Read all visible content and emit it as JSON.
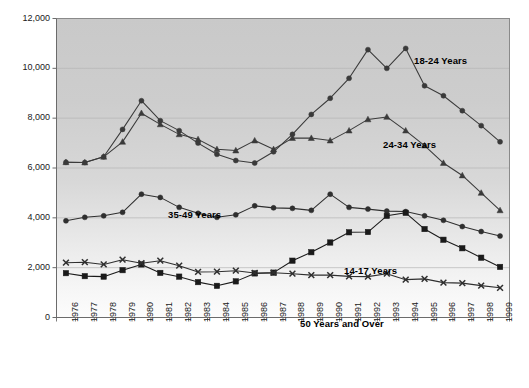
{
  "chart_data": {
    "type": "line",
    "title": "",
    "subtitle": "",
    "xlabel": "",
    "ylabel": "",
    "grid": true,
    "legend_position": "inline-annotations",
    "ylim": [
      0,
      12000
    ],
    "yticks": [
      0,
      2000,
      4000,
      6000,
      8000,
      10000,
      12000
    ],
    "ytick_labels": [
      "0",
      "2,000",
      "4,000",
      "6,000",
      "8,000",
      "10,000",
      "12,000"
    ],
    "x": [
      1976,
      1977,
      1978,
      1979,
      1980,
      1981,
      1982,
      1983,
      1984,
      1985,
      1986,
      1987,
      1988,
      1989,
      1990,
      1991,
      1992,
      1993,
      1994,
      1995,
      1996,
      1997,
      1998,
      1999
    ],
    "xtick_labels": [
      "1976",
      "1977",
      "1978",
      "1979",
      "1980",
      "1981",
      "1982",
      "1983",
      "1984",
      "1985",
      "1986",
      "1987",
      "1988",
      "1989",
      "1990",
      "1991",
      "1992",
      "1993",
      "1994",
      "1995",
      "1996",
      "1997",
      "1998",
      "1999"
    ],
    "series": [
      {
        "name": "18-24 Years",
        "marker": "circle",
        "color": "#3a3a3a",
        "label_x": 414,
        "label_y": 55,
        "values": [
          6230,
          6220,
          6450,
          7550,
          8700,
          7900,
          7500,
          7000,
          6550,
          6300,
          6200,
          6650,
          7350,
          8150,
          8800,
          9600,
          10750,
          10000,
          10800,
          9300,
          8900,
          8300,
          7700,
          7050
        ]
      },
      {
        "name": "24-34 Years",
        "marker": "triangle",
        "color": "#3a3a3a",
        "label_x": 383,
        "label_y": 139,
        "values": [
          6230,
          6220,
          6450,
          7050,
          8200,
          7750,
          7350,
          7150,
          6750,
          6700,
          7100,
          6750,
          7200,
          7200,
          7100,
          7500,
          7950,
          8050,
          7500,
          6900,
          6200,
          5700,
          5000,
          4300
        ]
      },
      {
        "name": "35-49 Years",
        "marker": "circle",
        "color": "#2f2f2f",
        "label_x": 168,
        "label_y": 209,
        "values": [
          3880,
          4020,
          4080,
          4220,
          4950,
          4820,
          4420,
          4180,
          4020,
          4120,
          4480,
          4400,
          4380,
          4300,
          4950,
          4420,
          4350,
          4270,
          4250,
          4080,
          3900,
          3650,
          3450,
          3270
        ]
      },
      {
        "name": "14-17 Years",
        "marker": "square",
        "color": "#1a1a1a",
        "label_x": 344,
        "label_y": 265,
        "values": [
          1780,
          1660,
          1640,
          1900,
          2130,
          1790,
          1640,
          1420,
          1270,
          1450,
          1770,
          1800,
          2280,
          2620,
          3010,
          3420,
          3430,
          4080,
          4200,
          3550,
          3120,
          2780,
          2400,
          2030
        ]
      },
      {
        "name": "50 Years and Over",
        "marker": "cross",
        "color": "#2f2f2f",
        "label_x": 300,
        "label_y": 318,
        "values": [
          2200,
          2220,
          2130,
          2320,
          2180,
          2280,
          2080,
          1830,
          1840,
          1880,
          1790,
          1800,
          1760,
          1700,
          1700,
          1650,
          1640,
          1760,
          1520,
          1550,
          1400,
          1380,
          1280,
          1190
        ]
      }
    ]
  }
}
